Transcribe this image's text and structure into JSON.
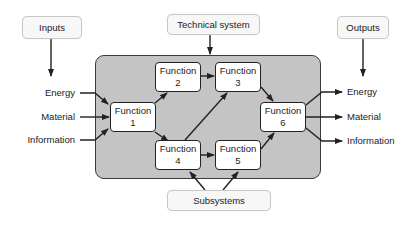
{
  "external_boxes": {
    "inputs": "Inputs",
    "technical_system": "Technical system",
    "outputs": "Outputs",
    "subsystems": "Subsystems"
  },
  "functions": [
    {
      "name": "Function",
      "num": "1"
    },
    {
      "name": "Function",
      "num": "2"
    },
    {
      "name": "Function",
      "num": "3"
    },
    {
      "name": "Function",
      "num": "4"
    },
    {
      "name": "Function",
      "num": "5"
    },
    {
      "name": "Function",
      "num": "6"
    }
  ],
  "input_flows": [
    "Energy",
    "Material",
    "Information"
  ],
  "output_flows": [
    "Energy",
    "Material",
    "Information"
  ],
  "colors": {
    "system_fill": "#c4c4c4",
    "system_border": "#3a3a3a",
    "function_fill": "#ffffff",
    "external_fill": "#f7f7f7",
    "arrow": "#222222"
  }
}
